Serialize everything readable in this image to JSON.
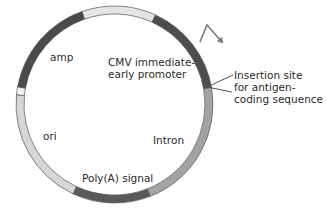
{
  "figure": {
    "center": [
      114.5,
      104.5
    ],
    "radius": 94.5,
    "ring_width": 8,
    "outline_color": "#555555",
    "segments": [
      {
        "name": "top-light",
        "label": "",
        "start_deg": 250.6,
        "end_deg": 294.6,
        "color": "#e4e4e4"
      },
      {
        "name": "cmv-promoter",
        "label": "CMV immediate-early promoter",
        "start_deg": 294.6,
        "end_deg": 350.0,
        "color": "#4d4d4d"
      },
      {
        "name": "intron",
        "label": "Intron",
        "start_deg": 350.0,
        "end_deg": 428.8,
        "color": "#a3a3a3"
      },
      {
        "name": "polya-signal",
        "label": "Poly(A) signal",
        "start_deg": 68.8,
        "end_deg": 114.9,
        "color": "#5a5a5a"
      },
      {
        "name": "ori",
        "label": "ori",
        "start_deg": 114.9,
        "end_deg": 185.7,
        "color": "#d6d6d6"
      },
      {
        "name": "spacer-white",
        "label": "",
        "start_deg": 185.7,
        "end_deg": 190.4,
        "color": "#f2f2f2"
      },
      {
        "name": "amp",
        "label": "amp",
        "start_deg": 190.4,
        "end_deg": 250.6,
        "color": "#4a4a4a"
      }
    ]
  },
  "labels": {
    "amp": "amp",
    "cmv": "CMV immediate-\nearly promoter",
    "insertion": "Insertion site\nfor antigen-\ncoding sequence",
    "ori": "ori",
    "intron": "Intron",
    "polya": "Poly(A) signal"
  },
  "promoter_arrow": {
    "points": [
      [
        200,
        42
      ],
      [
        207,
        25
      ],
      [
        222,
        42
      ]
    ],
    "color": "#7a7a7a"
  },
  "insertion_callout": {
    "apex": [
      207,
      87
    ],
    "to": [
      [
        233,
        75
      ],
      [
        232,
        92
      ]
    ],
    "color": "#555555"
  }
}
